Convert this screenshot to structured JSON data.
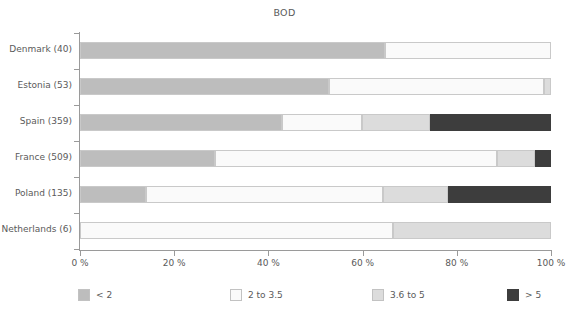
{
  "chart_data": {
    "type": "bar",
    "orientation": "horizontal",
    "stacked": true,
    "normalized_percent": true,
    "title": "BOD",
    "xlabel": "",
    "ylabel": "",
    "xlim": [
      0,
      100
    ],
    "grid": false,
    "legend_position": "bottom",
    "categories": [
      "Denmark (40)",
      "Estonia (53)",
      "Spain (359)",
      "France (509)",
      "Poland (135)",
      "Netherlands (6)"
    ],
    "x_tick_labels": [
      "0 %",
      "20 %",
      "40 %",
      "60 %",
      "80 %",
      "100 %"
    ],
    "x_tick_values": [
      0,
      20,
      40,
      60,
      80,
      100
    ],
    "series": [
      {
        "name": "< 2",
        "color": "#bdbdbd",
        "values": [
          64.8,
          52.9,
          42.9,
          28.7,
          14.0,
          0.0
        ]
      },
      {
        "name": "2 to 3.5",
        "color": "#fafafa",
        "values": [
          35.2,
          45.6,
          17.0,
          59.8,
          50.3,
          66.5
        ]
      },
      {
        "name": "3.6 to 5",
        "color": "#dcdcdc",
        "values": [
          0.0,
          1.5,
          14.4,
          8.1,
          13.8,
          33.5
        ]
      },
      {
        "name": "> 5",
        "color": "#3d3d3d",
        "values": [
          0.0,
          0.0,
          25.7,
          3.4,
          21.9,
          0.0
        ]
      }
    ],
    "colors": {
      "axis": "#9a9a9a",
      "text": "#5a5a5a",
      "segment_border": "#c9c9c9",
      "background": "#ffffff"
    }
  }
}
